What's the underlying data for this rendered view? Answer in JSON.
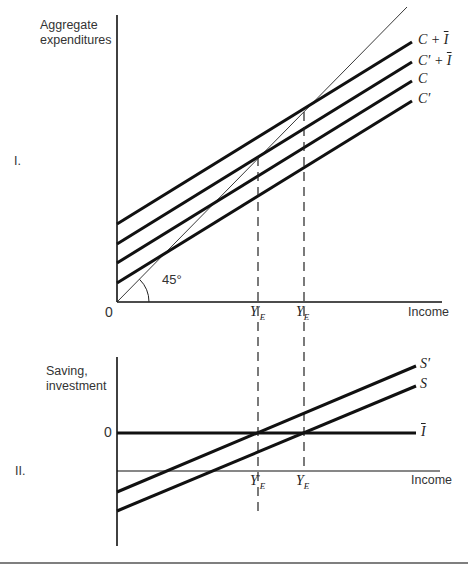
{
  "panel_I": {
    "label": "I.",
    "y_axis_label_line1": "Aggregate",
    "y_axis_label_line2": "expenditures",
    "x_axis_label": "Income",
    "origin": "0",
    "angle_label": "45°",
    "curves": [
      {
        "name": "C + Ī",
        "main": "C + ",
        "bar": "I"
      },
      {
        "name": "C′ + Ī",
        "main": "C′ + ",
        "bar": "I"
      },
      {
        "name": "C",
        "main": "C"
      },
      {
        "name": "C′",
        "main": "C′"
      }
    ],
    "equilibria": [
      {
        "name": "Y′E",
        "main": "Y",
        "prime": "′",
        "sub": "E"
      },
      {
        "name": "YE",
        "main": "Y",
        "sub": "E"
      }
    ]
  },
  "panel_II": {
    "label": "II.",
    "y_axis_label_line1": "Saving,",
    "y_axis_label_line2": "investment",
    "zero_label": "0",
    "x_axis_label": "Income",
    "curves": [
      {
        "name": "S′",
        "main": "S′"
      },
      {
        "name": "S",
        "main": "S"
      },
      {
        "name": "Ī",
        "bar": "I"
      }
    ],
    "equilibria": [
      {
        "name": "Y′E",
        "main": "Y",
        "prime": "′",
        "sub": "E"
      },
      {
        "name": "YE",
        "main": "Y",
        "sub": "E"
      }
    ]
  },
  "colors": {
    "line": "#111111",
    "text": "#333333",
    "background": "#ffffff"
  }
}
